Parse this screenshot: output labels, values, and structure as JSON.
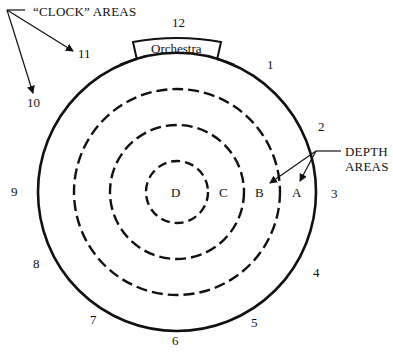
{
  "diagram": {
    "title_clock": "“CLOCK” AREAS",
    "title_depth_line1": "DEPTH",
    "title_depth_line2": "AREAS",
    "stage_label": "Orchestra",
    "clock_positions": [
      "12",
      "1",
      "2",
      "3",
      "4",
      "5",
      "6",
      "7",
      "8",
      "9",
      "10",
      "11"
    ],
    "depth_areas": [
      "A",
      "B",
      "C",
      "D"
    ],
    "colors": {
      "stroke": "#111111",
      "background": "#ffffff"
    }
  }
}
